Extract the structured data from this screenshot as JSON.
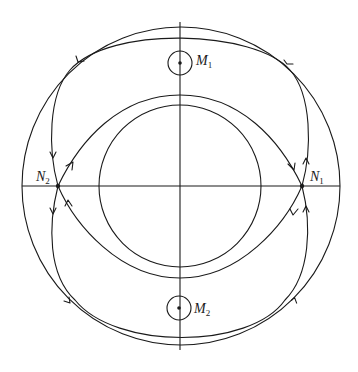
{
  "diagram": {
    "type": "phase-portrait",
    "stroke_color": "#1a1a1a",
    "background": "#ffffff",
    "center": [
      180,
      186
    ],
    "axes": {
      "horizontal": {
        "x1": 22,
        "x2": 340,
        "y": 186
      },
      "vertical": {
        "x": 180,
        "y1": 22,
        "y2": 350
      }
    },
    "outer_circle": {
      "r": 160,
      "direction": "counterclockwise"
    },
    "inner_circle": {
      "r": 81
    },
    "points": {
      "N1": {
        "label": "N",
        "sub": "1",
        "x": 302,
        "y": 186,
        "kind": "saddle"
      },
      "N2": {
        "label": "N",
        "sub": "2",
        "x": 58,
        "y": 186,
        "kind": "saddle"
      },
      "M1": {
        "label": "M",
        "sub": "1",
        "x": 180,
        "y": 63,
        "r": 12,
        "kind": "center"
      },
      "M2": {
        "label": "M",
        "sub": "2",
        "x": 179,
        "y": 308,
        "r": 12,
        "kind": "center"
      }
    },
    "separatrices": [
      {
        "name": "outer-upper",
        "from": "N1",
        "to": "N2",
        "via_top": 34
      },
      {
        "name": "outer-lower",
        "from": "N2",
        "to": "N1",
        "via_bottom": 340
      },
      {
        "name": "inner-upper",
        "from": "N2",
        "to": "N1",
        "via_top": 95
      },
      {
        "name": "inner-lower",
        "from": "N1",
        "to": "N2",
        "via_bottom": 278
      }
    ]
  }
}
